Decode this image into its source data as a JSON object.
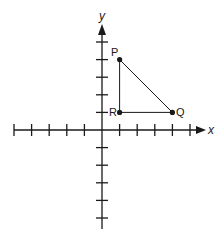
{
  "diagram": {
    "type": "coordinate-plane",
    "axes": {
      "x_label": "x",
      "y_label": "y",
      "x_ticks_negative": 5,
      "x_ticks_positive": 5,
      "y_ticks_positive": 5,
      "y_ticks_negative": 5
    },
    "points": [
      {
        "label": "P",
        "x": 1,
        "y": 4
      },
      {
        "label": "Q",
        "x": 4,
        "y": 1
      },
      {
        "label": "R",
        "x": 1,
        "y": 1
      }
    ],
    "segments": [
      [
        "P",
        "Q"
      ],
      [
        "Q",
        "R"
      ],
      [
        "R",
        "P"
      ]
    ],
    "colors": {
      "ink": "#1a1a1a",
      "background": "#ffffff"
    }
  }
}
